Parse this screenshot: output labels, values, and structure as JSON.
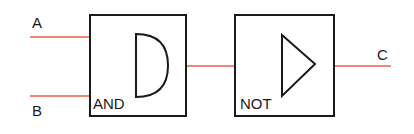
{
  "diagram": {
    "type": "logic-circuit",
    "colors": {
      "wire": "#e8604c",
      "stroke": "#1a1a1a",
      "background": "#ffffff"
    },
    "inputs": [
      {
        "id": "A",
        "label": "A"
      },
      {
        "id": "B",
        "label": "B"
      }
    ],
    "gates": [
      {
        "id": "and",
        "label": "AND",
        "type": "and"
      },
      {
        "id": "not",
        "label": "NOT",
        "type": "not"
      }
    ],
    "output": {
      "id": "C",
      "label": "C"
    },
    "connections": [
      {
        "from": "A",
        "to": "and"
      },
      {
        "from": "B",
        "to": "and"
      },
      {
        "from": "and",
        "to": "not"
      },
      {
        "from": "not",
        "to": "C"
      }
    ]
  }
}
